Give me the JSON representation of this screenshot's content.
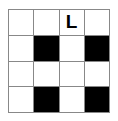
{
  "puzzle": {
    "type": "crossword-grid",
    "rows": 4,
    "columns": 4,
    "colors": {
      "open_cell": "#ffffff",
      "blocked_cell": "#000000",
      "grid_line": "#888888",
      "letter": "#000000",
      "background": "#ffffff"
    },
    "cells": [
      {
        "row": 0,
        "col": 0,
        "state": "open",
        "letter": ""
      },
      {
        "row": 0,
        "col": 1,
        "state": "open",
        "letter": ""
      },
      {
        "row": 0,
        "col": 2,
        "state": "open",
        "letter": "L"
      },
      {
        "row": 0,
        "col": 3,
        "state": "open",
        "letter": ""
      },
      {
        "row": 1,
        "col": 0,
        "state": "open",
        "letter": ""
      },
      {
        "row": 1,
        "col": 1,
        "state": "blocked",
        "letter": ""
      },
      {
        "row": 1,
        "col": 2,
        "state": "open",
        "letter": ""
      },
      {
        "row": 1,
        "col": 3,
        "state": "blocked",
        "letter": ""
      },
      {
        "row": 2,
        "col": 0,
        "state": "open",
        "letter": ""
      },
      {
        "row": 2,
        "col": 1,
        "state": "open",
        "letter": ""
      },
      {
        "row": 2,
        "col": 2,
        "state": "open",
        "letter": ""
      },
      {
        "row": 2,
        "col": 3,
        "state": "open",
        "letter": ""
      },
      {
        "row": 3,
        "col": 0,
        "state": "open",
        "letter": ""
      },
      {
        "row": 3,
        "col": 1,
        "state": "blocked",
        "letter": ""
      },
      {
        "row": 3,
        "col": 2,
        "state": "open",
        "letter": ""
      },
      {
        "row": 3,
        "col": 3,
        "state": "blocked",
        "letter": ""
      }
    ]
  }
}
